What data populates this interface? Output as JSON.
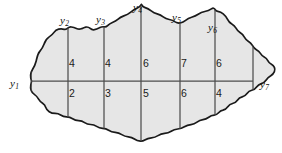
{
  "figure": {
    "name": "irregular-area-offsets-diagram",
    "colors": {
      "fill": "#e6e6e6",
      "outline": "#1a1a1a",
      "ordinate_line": "#4d4d4d",
      "base_line": "#4d4d4d",
      "text": "#111111",
      "background": "#ffffff"
    }
  },
  "ordinates": [
    {
      "id": "y1",
      "letter": "y",
      "subscript": "1",
      "x": 31,
      "label_x": 10,
      "label_y": 78
    },
    {
      "id": "y2",
      "letter": "y",
      "subscript": "2",
      "x": 68,
      "label_x": 60,
      "label_y": 15
    },
    {
      "id": "y3",
      "letter": "y",
      "subscript": "3",
      "x": 104,
      "label_x": 96,
      "label_y": 14
    },
    {
      "id": "y4",
      "letter": "y",
      "subscript": "4",
      "x": 141,
      "label_x": 133,
      "label_y": 2
    },
    {
      "id": "y5",
      "letter": "y",
      "subscript": "5",
      "x": 180,
      "label_x": 172,
      "label_y": 12
    },
    {
      "id": "y6",
      "letter": "y",
      "subscript": "6",
      "x": 215,
      "label_x": 208,
      "label_y": 22
    },
    {
      "id": "y7",
      "letter": "y",
      "subscript": "7",
      "x": 253,
      "label_x": 260,
      "label_y": 79
    }
  ],
  "offsets": {
    "upper": [
      {
        "value": "4",
        "x": 72,
        "y": 58
      },
      {
        "value": "4",
        "x": 108,
        "y": 58
      },
      {
        "value": "6",
        "x": 146,
        "y": 58
      },
      {
        "value": "7",
        "x": 184,
        "y": 58
      },
      {
        "value": "6",
        "x": 219,
        "y": 58
      }
    ],
    "lower": [
      {
        "value": "2",
        "x": 72,
        "y": 88
      },
      {
        "value": "3",
        "x": 108,
        "y": 88
      },
      {
        "value": "5",
        "x": 146,
        "y": 88
      },
      {
        "value": "6",
        "x": 184,
        "y": 88
      },
      {
        "value": "4",
        "x": 219,
        "y": 88
      }
    ]
  },
  "geometry": {
    "base_line": {
      "x1": 31,
      "y1": 81,
      "x2": 253,
      "y2": 81
    },
    "outline_path": "M 31.5 81 C 30 76.5 30.6 72.5 32.5 69.5 C 34.2 66.8 35.4 64.2 36.2 61 C 37.0 57.6 37.4 54.2 39.6 51.6 C 41.4 49.4 43.0 47.0 44.0 44.2 C 45.0 41.4 46.2 39.0 48.6 37.4 C 50.8 35.9 52.6 34.5 54.0 32.4 C 55.2 30.6 56.6 29.6 58.6 29.2 C 60.6 28.8 62.4 28.9 64.2 29.3 C 65.6 29.6 66.8 29.2 67.8 28.2 C 68.8 27.2 70.0 26.8 71.4 27.0 C 73.2 27.3 74.8 27.8 76.4 28.5 C 78.0 29.2 79.6 29.4 81.2 28.8 C 82.8 28.2 84.2 27.4 85.8 27.1 C 87.6 26.8 89.0 27.3 90.2 28.4 C 91.4 29.5 92.8 30.0 94.4 29.7 C 96.2 29.3 97.8 28.6 99.4 27.8 C 100.9 27.0 102.4 26.6 104.0 26.8 C 105.4 27.0 106.6 26.6 107.6 25.6 C 109.0 24.2 110.6 23.2 112.4 22.5 C 114.4 21.7 116.2 20.8 117.8 19.4 C 119.6 17.8 121.6 16.7 123.8 15.9 C 126.2 15.0 128.4 13.9 130.4 12.3 C 132.6 10.5 134.8 9.0 137.4 8.0 C 139.2 7.3 140.6 6.2 141.4 4.4 C 142.0 5.9 143.0 6.9 144.6 7.4 C 147.0 8.2 149.2 9.3 151.2 10.9 C 153.0 12.3 155.0 13.3 157.2 13.9 C 159.4 14.5 161.4 15.4 163.2 16.8 C 165.0 18.2 167.0 19.1 169.2 19.5 C 171.4 19.9 173.4 20.6 175.2 21.9 C 176.8 23.0 178.4 23.4 180.2 23.0 C 182.2 22.5 184.0 21.6 185.6 20.3 C 187.4 18.8 189.4 17.8 191.6 17.2 C 194.0 16.5 196.2 15.6 198.2 14.2 C 200.2 12.8 202.4 11.9 204.8 11.5 C 207.2 11.1 209.4 10.3 211.4 8.9 C 213.0 7.8 214.2 8.0 215.0 9.5 C 215.6 10.6 216.6 11.2 217.8 11.4 C 219.8 11.8 221.6 12.6 223.2 13.9 C 225.0 15.4 226.4 17.1 227.4 19.2 C 228.4 21.3 229.8 22.9 231.8 24.0 C 233.6 25.0 235.0 26.4 236.0 28.2 C 237.0 30.0 238.2 31.5 240.0 32.6 C 241.8 33.7 243.2 35.1 244.2 36.9 C 245.2 38.7 246.4 40.2 248.2 41.2 C 250.0 42.2 251.4 43.6 252.4 45.4 C 253.4 47.2 254.6 48.7 256.4 49.7 C 258.0 50.6 259.4 51.8 260.4 53.4 C 261.4 55.0 262.6 56.2 264.2 57.0 C 265.8 57.8 267.0 59.0 267.8 60.6 C 268.6 62.2 269.8 63.4 271.4 64.2 C 272.8 64.9 273.8 66.0 274.4 67.4 C 275.0 68.8 275.0 70.2 274.4 71.6 C 273.6 73.4 272.4 74.8 270.8 75.8 C 269.0 76.9 267.4 78.2 266.2 80.0 C 265.0 81.8 263.4 83.0 261.4 83.6 C 259.4 84.2 257.8 85.3 256.6 87.0 C 255.4 88.7 253.8 89.8 251.8 90.3 C 249.8 90.8 248.2 91.9 247.0 93.6 C 245.8 95.3 244.2 96.4 242.2 96.9 C 240.2 97.4 238.6 98.5 237.4 100.2 C 236.2 101.9 234.6 103.0 232.6 103.5 C 230.6 104.0 229.0 105.1 227.8 106.8 C 226.6 108.5 225.0 109.6 223.0 110.1 C 221.2 110.5 219.8 111.4 218.6 112.8 C 217.4 114.2 216.0 115.0 214.2 115.2 C 212.2 115.4 210.4 116.0 208.8 117.2 C 207.0 118.5 205.2 119.4 203.0 119.7 C 200.8 120.0 198.8 120.8 197.0 122.2 C 195.2 123.6 193.2 124.4 191.0 124.6 C 188.6 124.8 186.4 125.5 184.4 126.8 C 182.4 128.1 180.2 128.8 177.8 129.0 C 175.4 129.2 173.2 129.9 171.2 131.2 C 169.2 132.5 167.0 133.2 164.6 133.4 C 162.2 133.6 160.0 134.3 158.0 135.6 C 156.0 136.9 153.8 137.6 151.4 137.8 C 149.0 138.0 146.8 138.7 144.8 140.0 C 143.4 140.9 142.0 141.3 140.4 141.2 C 138.2 141.0 136.2 140.3 134.4 139.0 C 132.6 137.7 130.6 137.0 128.4 136.8 C 126.0 136.6 123.8 135.9 121.8 134.6 C 119.8 133.3 117.6 132.6 115.2 132.4 C 112.8 132.2 110.6 131.5 108.6 130.2 C 106.8 129.0 104.8 128.4 102.6 128.3 C 100.4 128.2 98.4 127.6 96.6 126.4 C 94.8 125.2 92.8 124.6 90.6 124.5 C 88.4 124.4 86.4 123.8 84.6 122.6 C 82.8 121.4 80.8 120.8 78.6 120.7 C 76.4 120.6 74.4 120.0 72.6 118.8 C 70.8 117.6 68.8 117.0 66.6 116.9 C 64.4 116.8 62.4 116.2 60.6 115.0 C 59.0 113.9 57.2 113.4 55.2 113.4 C 53.0 113.4 51.0 112.9 49.2 111.7 C 47.6 110.6 46.4 109.2 45.8 107.4 C 45.2 105.6 44.2 104.2 42.6 103.2 C 40.8 102.1 39.4 100.7 38.4 98.9 C 37.4 97.1 36.2 95.6 34.6 94.6 C 33.0 93.6 31.8 92.2 31.2 90.4 C 30.6 88.6 30.4 86.8 30.8 85.0 C 31.1 83.6 31.4 82.3 31.5 81 Z"
  }
}
